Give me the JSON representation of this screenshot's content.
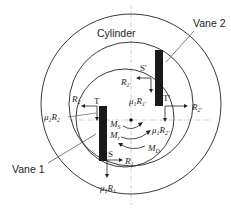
{
  "diagram": {
    "labels": {
      "cylinder": "Cylinder",
      "vane1": "Vane 1",
      "vane2": "Vane 2"
    },
    "points": {
      "S": "S",
      "T": "T",
      "S_prime": "S'",
      "T_prime": "T'"
    },
    "forces": {
      "R1": "R1",
      "R2": "R2",
      "mu1R1": "μ1R1",
      "mu1R2": "μ1R2",
      "R1p": "R1'",
      "R2p": "R2'",
      "mu1R1p": "μ1R1'",
      "mu1R2p": "μ1R2'"
    },
    "moments": {
      "MS": "MS",
      "Mr": "Mr",
      "MD": "MD"
    },
    "colors": {
      "line": "#222222",
      "vane": "#1a1a1a",
      "guide": "#999999"
    }
  }
}
